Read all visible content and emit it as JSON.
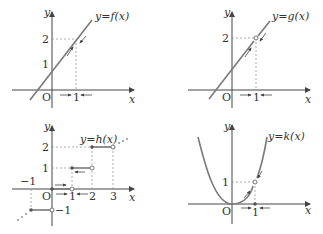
{
  "panels": [
    {
      "id": "f",
      "function_label": "y=f(x)",
      "x_axis_label": "x",
      "y_axis_label": "y",
      "origin_label": "O",
      "tick_labels_x": [
        "1"
      ],
      "tick_labels_y": [
        "1",
        "2"
      ],
      "description": "Continuous line through (1, 2); arrows approach x=1 from both sides and f(x) approaches 2."
    },
    {
      "id": "g",
      "function_label": "y=g(x)",
      "x_axis_label": "x",
      "y_axis_label": "y",
      "origin_label": "O",
      "tick_labels_x": [
        "1"
      ],
      "tick_labels_y": [
        "2"
      ],
      "description": "Line with an open circle (hole) at (1, 2); g(x) approaches 2 as x approaches 1."
    },
    {
      "id": "h",
      "function_label": "y=h(x)",
      "x_axis_label": "x",
      "y_axis_label": "y",
      "origin_label": "O",
      "tick_labels_x": [
        "-1",
        "1",
        "2",
        "3"
      ],
      "tick_labels_y": [
        "1",
        "2",
        "-1"
      ],
      "description": "Step (floor) function with closed dots at left endpoints and open circles at right endpoints."
    },
    {
      "id": "k",
      "function_label": "y=k(x)",
      "x_axis_label": "x",
      "y_axis_label": "y",
      "origin_label": "O",
      "tick_labels_x": [
        "1"
      ],
      "tick_labels_y": [
        "1"
      ],
      "description": "Parabola through origin with open circle at (1, 1) and a filled point at x=1 on the x-axis."
    }
  ],
  "labels": {
    "f_fn": "y=f(x)",
    "g_fn": "y=g(x)",
    "h_fn": "y=h(x)",
    "k_fn": "y=k(x)",
    "x": "x",
    "y": "y",
    "O": "O",
    "one": "1",
    "two": "2",
    "three": "3",
    "neg_one": "−1"
  }
}
